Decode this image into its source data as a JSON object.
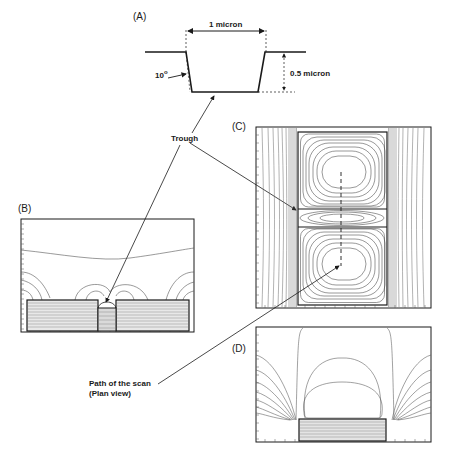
{
  "figure": {
    "panels": [
      {
        "id": "A",
        "label": "(A)"
      },
      {
        "id": "B",
        "label": "(B)"
      },
      {
        "id": "C",
        "label": "(C)"
      },
      {
        "id": "D",
        "label": "(D)"
      }
    ],
    "panel_a": {
      "width_label": "1 micron",
      "depth_label": "0.5 micron",
      "angle_label": "10",
      "angle_unit": "o"
    },
    "annotations": {
      "trough": "Trough",
      "scan_path_line1": "Path of the scan",
      "scan_path_line2": "(Plan view)"
    },
    "colors": {
      "ink": "#1a1a1a",
      "contour": "#444444",
      "background": "#ffffff"
    }
  }
}
